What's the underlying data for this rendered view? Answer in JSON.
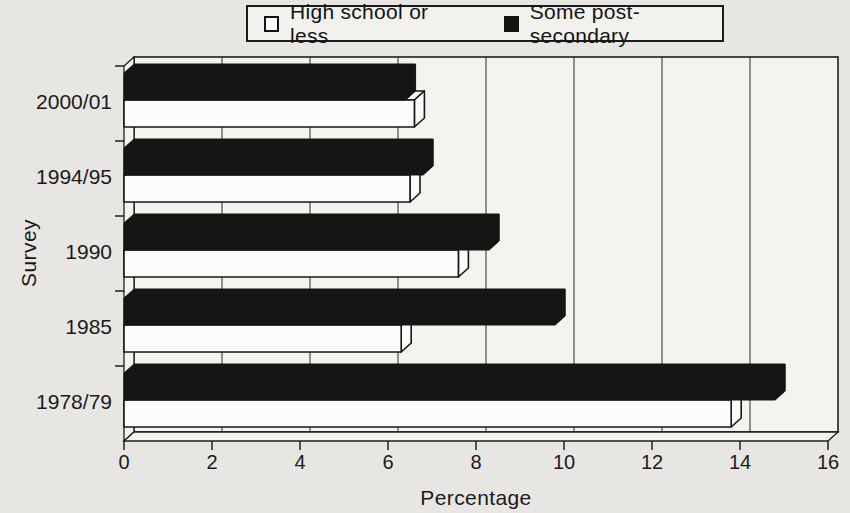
{
  "colors": {
    "background": "#e8e6e2",
    "plot_fill": "#f4f3f0",
    "line": "#1f1f1f",
    "text": "#1a1a1a",
    "bar_black": "#171513",
    "bar_white": "#fcfcfa"
  },
  "chart_data": {
    "type": "bar",
    "orientation": "horizontal",
    "style": "3d",
    "title": "",
    "categories": [
      "2000/01",
      "1994/95",
      "1990",
      "1985",
      "1978/79"
    ],
    "series": [
      {
        "name": "High school or less",
        "swatch": "white",
        "color": "#fcfcfa",
        "values": [
          6.6,
          6.5,
          7.6,
          6.3,
          13.8
        ]
      },
      {
        "name": "Some post-secondary",
        "swatch": "black",
        "color": "#171513",
        "values": [
          6.4,
          6.8,
          8.3,
          9.8,
          14.8
        ]
      }
    ],
    "row_order_within_group": [
      "Some post-secondary",
      "High school or less"
    ],
    "xlabel": "Percentage",
    "ylabel": "Survey",
    "xlim": [
      0,
      16
    ],
    "xticks": [
      0,
      2,
      4,
      6,
      8,
      10,
      12,
      14,
      16
    ],
    "grid": "vertical",
    "legend_position": "top"
  }
}
